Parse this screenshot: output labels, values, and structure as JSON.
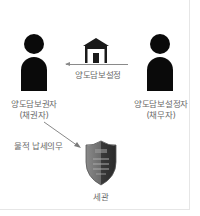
{
  "diagram": {
    "creditor": {
      "name": "양도담보권자",
      "role": "(채권자)"
    },
    "debtor": {
      "name": "양도담보설정자",
      "role": "(채무자)"
    },
    "transfer_arrow": {
      "label": "양도담보설정",
      "icon": "house-icon",
      "direction": "debtor-to-creditor"
    },
    "tax_arrow": {
      "label": "물적 납세의무",
      "direction": "creditor-to-customs"
    },
    "customs": {
      "name": "세관",
      "icon": "shield-icon"
    }
  },
  "colors": {
    "figure": "#0a0a0a",
    "text": "#6a6a6a",
    "arrow": "#8a8a8a",
    "shield_dark": "#3a3a3a",
    "shield_light": "#7a7a7a"
  }
}
